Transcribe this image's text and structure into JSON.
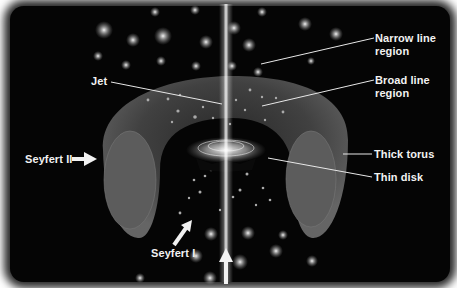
{
  "labels": {
    "narrow_line_region": "Narrow line",
    "narrow_line_region_2": "region",
    "broad_line_region": "Broad line",
    "broad_line_region_2": "region",
    "jet": "Jet",
    "thick_torus": "Thick torus",
    "thin_disk": "Thin disk",
    "seyfert_ii": "Seyfert II",
    "seyfert_i": "Seyfert I"
  },
  "colors": {
    "background": "#050505",
    "torus": "#5a5a5a",
    "label_text": "#f2f2f2",
    "jet": "#e8e8e8"
  }
}
